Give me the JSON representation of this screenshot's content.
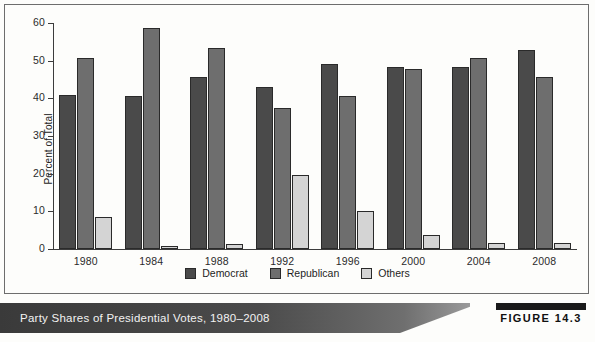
{
  "figure": {
    "caption": "Party Shares of Presidential Votes, 1980–2008",
    "number_label": "FIGURE 14.3"
  },
  "legend": {
    "position": "bottom-center",
    "items": [
      {
        "label": "Democrat",
        "color": "#4a4a4a"
      },
      {
        "label": "Republican",
        "color": "#6e6e6e"
      },
      {
        "label": "Others",
        "color": "#d4d4d4"
      }
    ]
  },
  "axis": {
    "y_label": "Percent of Total",
    "y_ticks": [
      "0",
      "10",
      "20",
      "30",
      "40",
      "50",
      "60"
    ]
  },
  "chart_data": {
    "type": "bar",
    "title": "Party Shares of Presidential Votes, 1980–2008",
    "xlabel": "",
    "ylabel": "Percent of Total",
    "ylim": [
      0,
      60
    ],
    "ytick_step": 10,
    "grid": false,
    "legend_position": "bottom-center",
    "categories": [
      "1980",
      "1984",
      "1988",
      "1992",
      "1996",
      "2000",
      "2004",
      "2008"
    ],
    "series": [
      {
        "name": "Democrat",
        "color": "#4a4a4a",
        "values": [
          41.0,
          40.6,
          45.7,
          43.0,
          49.2,
          48.4,
          48.3,
          52.9
        ]
      },
      {
        "name": "Republican",
        "color": "#6e6e6e",
        "values": [
          50.8,
          58.8,
          53.4,
          37.5,
          40.7,
          47.9,
          50.7,
          45.7
        ]
      },
      {
        "name": "Others",
        "color": "#d4d4d4",
        "values": [
          8.4,
          0.7,
          1.2,
          19.7,
          10.1,
          3.8,
          1.5,
          1.6
        ]
      }
    ]
  }
}
